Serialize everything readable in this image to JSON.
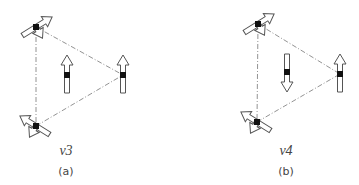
{
  "figure": {
    "panels": [
      {
        "id": "a",
        "mode_label": "ν3",
        "panel_label": "(a)",
        "center_arrow_direction": "up"
      },
      {
        "id": "b",
        "mode_label": "ν4",
        "panel_label": "(b)",
        "center_arrow_direction": "down"
      }
    ],
    "colors": {
      "stroke": "#555555",
      "atom": "#111111",
      "dashed": "#777777",
      "arrow_fill": "#ffffff"
    }
  }
}
